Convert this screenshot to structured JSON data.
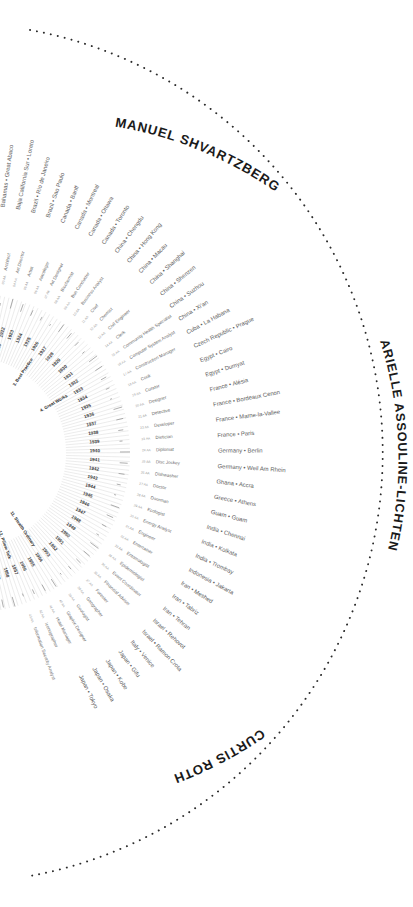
{
  "meta": {
    "kind": "radial-polar-infographic",
    "background": "#ffffff",
    "accent_dark": "#1a1a1a",
    "accent_mid": "#6a6a6a",
    "accent_light": "#c2c2c2",
    "center_x": -30,
    "center_y": 453,
    "view_width": 413,
    "view_height": 907
  },
  "authors": [
    {
      "name": "MANUEL SHVARTZBERG",
      "position": "top-arc"
    },
    {
      "name": "ARIELLE ASSOULINE-LICHTEN",
      "position": "right-arc"
    },
    {
      "name": "CURTIS ROTH",
      "position": "bottom-arc"
    }
  ],
  "rings": {
    "locations_label": "Country • City",
    "professions_label": "Profession",
    "years_label": "Year",
    "firms_label": "Architecture Firms"
  },
  "locations": [
    "Bahamas • Great Abaco",
    "Baja California Sur • Loreto",
    "Brazil • Rio de Janeiro",
    "Brazil • Sao Paulo",
    "Canada • Banff",
    "Canada • Montreal",
    "Canada • Ottawa",
    "Canada • Toronto",
    "China • Chengdu",
    "China • Hong Kong",
    "China • Macau",
    "China • Shanghai",
    "China • Shenzen",
    "China • Suzhou",
    "China • Xi'an",
    "Cuba • La Habana",
    "Czech Republic • Prague",
    "Egypt • Cairo",
    "Egypt • Dumyat",
    "France • Alésia",
    "France • Bordeaux Cenon",
    "France • Marne-la-Vallee",
    "France • Paris",
    "Germany • Berlin",
    "Germany • Weil Am Rhein",
    "Ghana • Accra",
    "Greece • Athens",
    "Guam • Guam",
    "India • Chennai",
    "India • Kolkata",
    "India • Trombay",
    "Indonesia • Jakarta",
    "Iran • Meshed",
    "Iran • Tabriz",
    "Iran • Tehran",
    "Israel • Rehovot",
    "Israel • Ramon Crota",
    "Italy • Venice",
    "Japan • Gifu",
    "Japan • Kobe",
    "Japan • Osaka",
    "Japan • Tokyo"
  ],
  "professions": [
    {
      "num": "01 AA",
      "label": "Anthropologist"
    },
    {
      "num": "02 AA",
      "label": "Archaeologist"
    },
    {
      "num": "03 AA",
      "label": "Architect"
    },
    {
      "num": "04 AA",
      "label": "Art Director"
    },
    {
      "num": "05 AA",
      "label": "Artist"
    },
    {
      "num": "06 AA",
      "label": "Astrologer"
    },
    {
      "num": "07 AA",
      "label": "Art Designer"
    },
    {
      "num": "08 AA",
      "label": "Biochemist"
    },
    {
      "num": "09 AA",
      "label": "Bus Conductor"
    },
    {
      "num": "10 AA",
      "label": "Business Analyst"
    },
    {
      "num": "11 AA",
      "label": "Chef"
    },
    {
      "num": "12 AA",
      "label": "Chemist"
    },
    {
      "num": "13 AA",
      "label": "Civil Engineer"
    },
    {
      "num": "14 AA",
      "label": "Clerk"
    },
    {
      "num": "15 AA",
      "label": "Community Health Specialist"
    },
    {
      "num": "16 AA",
      "label": "Computer System Analyst"
    },
    {
      "num": "17 AA",
      "label": "Construction Manager"
    },
    {
      "num": "18 AA",
      "label": "Cook"
    },
    {
      "num": "19 AA",
      "label": "Curator"
    },
    {
      "num": "20 AA",
      "label": "Designer"
    },
    {
      "num": "21 AA",
      "label": "Detective"
    },
    {
      "num": "22 AA",
      "label": "Developer"
    },
    {
      "num": "23 AA",
      "label": "Dietician"
    },
    {
      "num": "24 AA",
      "label": "Diplomat"
    },
    {
      "num": "25 AA",
      "label": "Disc Jockey"
    },
    {
      "num": "26 AA",
      "label": "Dishwasher"
    },
    {
      "num": "27 AA",
      "label": "Doctor"
    },
    {
      "num": "28 AA",
      "label": "Doorman"
    },
    {
      "num": "29 AA",
      "label": "Ecologist"
    },
    {
      "num": "30 AA",
      "label": "Energy Analyst"
    },
    {
      "num": "31 AA",
      "label": "Engineer"
    },
    {
      "num": "32 AA",
      "label": "Entertainer"
    },
    {
      "num": "33 AA",
      "label": "Entomologist"
    },
    {
      "num": "34 AA",
      "label": "Epidemiologist"
    },
    {
      "num": "35 AA",
      "label": "Event Coordinator"
    },
    {
      "num": "36 AA",
      "label": "Financial Advisor"
    },
    {
      "num": "37 AA",
      "label": "Forester"
    },
    {
      "num": "38 AA",
      "label": "Geographer"
    },
    {
      "num": "39 AA",
      "label": "Geologist"
    },
    {
      "num": "40 AA",
      "label": "Graphic Designer"
    },
    {
      "num": "41 AA",
      "label": "Hotel Manager"
    },
    {
      "num": "42 AA",
      "label": "Iconographer"
    },
    {
      "num": "43 AA",
      "label": "Information Security Analyst"
    }
  ],
  "years": [
    "1917",
    "1918",
    "1919",
    "1920",
    "1921",
    "1922",
    "1923",
    "1924",
    "1925",
    "1926",
    "1927",
    "1928",
    "1929",
    "1930",
    "1931",
    "1932",
    "1933",
    "1934",
    "1935",
    "1936",
    "1937",
    "1938",
    "1939",
    "1940",
    "1941",
    "1942",
    "1943",
    "1944",
    "1945",
    "1946",
    "1947",
    "1948",
    "1949",
    "1950",
    "1951",
    "1952",
    "1953",
    "1954",
    "1955",
    "1956",
    "1957",
    "1958",
    "1959",
    "1960",
    "1961"
  ],
  "sections": [
    {
      "num": "2.",
      "label": "Trojan Horses"
    },
    {
      "num": "3.",
      "label": "Best Practice"
    },
    {
      "num": "4.",
      "label": "Great Works"
    },
    {
      "num": "11.",
      "label": "Stealth Ordinary"
    },
    {
      "num": "12.",
      "label": "Pillow Talk"
    }
  ],
  "firms": [
    "Zimmer & Company",
    "Tuttle Bros and Associates",
    "Larsson Kahn Associates",
    "Skidmore and Associates",
    "Swanson Architects",
    "Andrew Architects",
    "Kevin Lloyd Wright",
    "VENTURI Architects",
    "Leuser",
    "George A. Fuller Company",
    "Bruckman Maurer Architects",
    "Goodhart Partners",
    "Graham, Anderson",
    "Probst & Wilde",
    "Dunbar Bekante and Associates",
    "Gaultheim Seigel Kaufman Architects",
    "HOLZMAN DOYL",
    "Harrison and Abramovitz",
    "Harry Weese Associates",
    "Hennesse Architects",
    "Skidmore Owings Merrill",
    "Henry and Clarke",
    "Bertrand Alley Morris",
    "KEVIN RIX",
    "ALL Arch"
  ],
  "dotted_arc": {
    "style": "dotted",
    "color": "#2b2b2b",
    "description": "outer boundary arc separating author names"
  }
}
